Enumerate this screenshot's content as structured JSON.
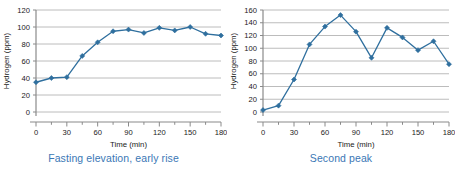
{
  "figure": {
    "panels": [
      {
        "id": "left",
        "caption": "Fasting elevation, early rise",
        "chart_data": {
          "type": "line",
          "title": "",
          "xlabel": "Time (min)",
          "ylabel": "Hydrogen (ppm)",
          "xlim": [
            0,
            180
          ],
          "ylim": [
            0,
            120
          ],
          "xticks": [
            0,
            30,
            60,
            90,
            120,
            150,
            180
          ],
          "xtick_labels": [
            "0",
            "30",
            "60",
            "90",
            "120",
            "150",
            "180"
          ],
          "minor_xtick_step": 15,
          "yticks": [
            0,
            20,
            40,
            60,
            80,
            100,
            120
          ],
          "ytick_labels": [
            "0",
            "20",
            "40",
            "60",
            "80",
            "100",
            "120"
          ],
          "grid": "horizontal",
          "legend": "none",
          "series": [
            {
              "name": "Hydrogen",
              "color": "#2f6f9e",
              "marker": "diamond",
              "x": [
                0,
                15,
                30,
                45,
                60,
                75,
                90,
                105,
                120,
                135,
                150,
                165,
                180
              ],
              "values": [
                35,
                40,
                41,
                66,
                82,
                95,
                97,
                93,
                99,
                96,
                100,
                92,
                90
              ]
            }
          ]
        }
      },
      {
        "id": "right",
        "caption": "Second peak",
        "chart_data": {
          "type": "line",
          "title": "",
          "xlabel": "Time (min)",
          "ylabel": "Hydrogen (ppm)",
          "xlim": [
            0,
            180
          ],
          "ylim": [
            0,
            160
          ],
          "xticks": [
            0,
            30,
            60,
            90,
            120,
            150,
            180
          ],
          "xtick_labels": [
            "0",
            "30",
            "60",
            "90",
            "120",
            "150",
            "180"
          ],
          "minor_xtick_step": 15,
          "yticks": [
            0,
            20,
            40,
            60,
            80,
            100,
            120,
            140,
            160
          ],
          "ytick_labels": [
            "0",
            "20",
            "40",
            "60",
            "80",
            "100",
            "120",
            "140",
            "160"
          ],
          "grid": "horizontal",
          "legend": "none",
          "series": [
            {
              "name": "Hydrogen",
              "color": "#2f6f9e",
              "marker": "diamond",
              "x": [
                0,
                15,
                30,
                45,
                60,
                75,
                90,
                105,
                120,
                135,
                150,
                165,
                180
              ],
              "values": [
                3,
                10,
                51,
                106,
                134,
                152,
                126,
                85,
                132,
                117,
                97,
                111,
                75
              ]
            }
          ]
        }
      }
    ]
  },
  "colors": {
    "series": "#2f6f9e",
    "caption": "#3a77b5",
    "grid": "#b4b4b4",
    "axis": "#8a8a8a",
    "text": "#1a1a1a",
    "background": "#ffffff"
  }
}
